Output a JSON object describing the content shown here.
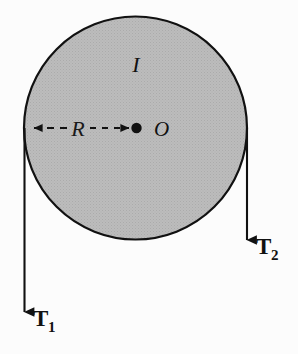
{
  "figure": {
    "background_color": "#fcfcfc",
    "width": 298,
    "height": 354
  },
  "disk": {
    "name": "pulley-disk",
    "fill_color": "#b9b9b9",
    "stroke_color": "#111111",
    "center_x": 135.5,
    "center_y": 128,
    "radius": 111.5,
    "stroke_width": 2.2,
    "moment_of_inertia_label": "I",
    "center_label": "O"
  },
  "radius_dimension": {
    "name": "radius-dimension",
    "label": "R",
    "label_x": 78,
    "label_y": 128,
    "start_x": 24,
    "end_x": 136,
    "y": 128,
    "style": "double-headed-dashed-arrow",
    "color": "#111111"
  },
  "forces": [
    {
      "id": "tension-1",
      "label": "T",
      "subscript": "1",
      "label_full": "T₁",
      "x": 24.5,
      "y_start": 128,
      "y_tip": 322,
      "label_x": 33,
      "label_y": 322,
      "direction": "down",
      "color": "#111111"
    },
    {
      "id": "tension-2",
      "label": "T",
      "subscript": "2",
      "label_full": "T₂",
      "x": 247,
      "y_start": 128,
      "y_tip": 250,
      "label_x": 256,
      "label_y": 250,
      "direction": "down",
      "color": "#111111"
    }
  ],
  "colors": {
    "ink": "#111111",
    "disk_gray": "#b9b9b9",
    "paper": "#fcfcfc"
  }
}
